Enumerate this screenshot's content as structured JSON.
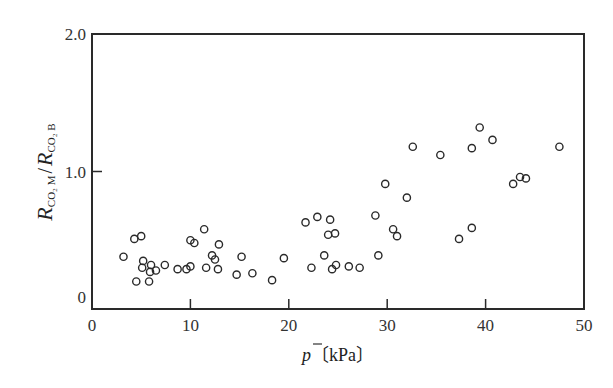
{
  "chart_data": {
    "type": "scatter",
    "title": "",
    "xlabel": "p̄ (kPa)",
    "xlabel_symbol": "p",
    "xlabel_unit": "〔kPa〕",
    "ylabel": "R_CO2 M / R_CO2 B",
    "ylabel_parts": {
      "r1": "R",
      "sub1": "CO₂ M",
      "slash": "/",
      "r2": "R",
      "sub2": "CO₂ B"
    },
    "xlim": [
      0,
      50
    ],
    "ylim": [
      0,
      2.0
    ],
    "x_ticks": [
      0,
      10,
      20,
      30,
      40,
      50
    ],
    "x_tick_labels": [
      "0",
      "10",
      "20",
      "30",
      "40",
      "50"
    ],
    "y_ticks": [
      0,
      1.0,
      2.0
    ],
    "y_tick_labels": [
      "0",
      "1.0",
      "2.0"
    ],
    "grid": false,
    "legend": null,
    "marker": "open-circle",
    "series": [
      {
        "name": "measurements",
        "points": [
          [
            3.2,
            0.38
          ],
          [
            4.3,
            0.51
          ],
          [
            5.0,
            0.53
          ],
          [
            5.2,
            0.35
          ],
          [
            5.1,
            0.3
          ],
          [
            6.0,
            0.32
          ],
          [
            5.9,
            0.27
          ],
          [
            6.5,
            0.28
          ],
          [
            4.5,
            0.2
          ],
          [
            5.8,
            0.2
          ],
          [
            7.4,
            0.32
          ],
          [
            8.7,
            0.29
          ],
          [
            9.6,
            0.29
          ],
          [
            10.0,
            0.31
          ],
          [
            10.0,
            0.5
          ],
          [
            10.4,
            0.48
          ],
          [
            11.4,
            0.58
          ],
          [
            12.9,
            0.47
          ],
          [
            12.2,
            0.39
          ],
          [
            12.5,
            0.36
          ],
          [
            11.6,
            0.3
          ],
          [
            12.8,
            0.29
          ],
          [
            15.2,
            0.38
          ],
          [
            14.7,
            0.25
          ],
          [
            16.3,
            0.26
          ],
          [
            18.3,
            0.21
          ],
          [
            19.5,
            0.37
          ],
          [
            21.7,
            0.63
          ],
          [
            22.9,
            0.67
          ],
          [
            24.2,
            0.65
          ],
          [
            24.0,
            0.54
          ],
          [
            24.7,
            0.55
          ],
          [
            23.6,
            0.39
          ],
          [
            22.3,
            0.3
          ],
          [
            24.8,
            0.32
          ],
          [
            24.4,
            0.29
          ],
          [
            26.1,
            0.31
          ],
          [
            27.2,
            0.3
          ],
          [
            28.8,
            0.68
          ],
          [
            29.1,
            0.39
          ],
          [
            29.8,
            0.91
          ],
          [
            32.0,
            0.81
          ],
          [
            30.6,
            0.58
          ],
          [
            31.0,
            0.53
          ],
          [
            32.6,
            1.18
          ],
          [
            35.4,
            1.12
          ],
          [
            37.3,
            0.51
          ],
          [
            38.6,
            0.59
          ],
          [
            38.6,
            1.17
          ],
          [
            39.4,
            1.32
          ],
          [
            40.7,
            1.23
          ],
          [
            42.8,
            0.91
          ],
          [
            43.5,
            0.96
          ],
          [
            44.1,
            0.95
          ],
          [
            47.5,
            1.18
          ]
        ]
      }
    ]
  }
}
